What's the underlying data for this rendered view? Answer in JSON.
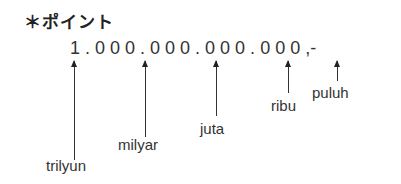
{
  "title": "＊ポイント",
  "number": "1 . 0 0 0 . 0 0 0 . 0 0 0 . 0 0 0 ,-",
  "labels": {
    "trilyun": "trilyun",
    "milyar": "milyar",
    "juta": "juta",
    "ribu": "ribu",
    "puluh": "puluh"
  }
}
